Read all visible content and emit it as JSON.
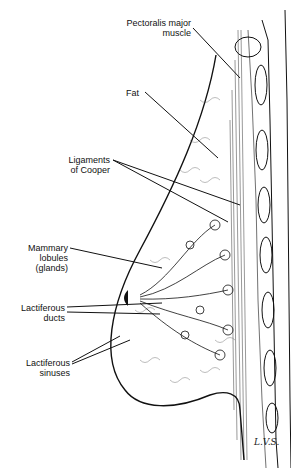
{
  "figure": {
    "type": "anatomical illustration",
    "background": "#ffffff",
    "ink": "#111111"
  },
  "labels": [
    {
      "id": "pectoralis",
      "line1": "Pectoralis major",
      "line2": "muscle"
    },
    {
      "id": "fat",
      "line1": "Fat",
      "line2": ""
    },
    {
      "id": "cooper",
      "line1": "Ligaments",
      "line2": "of Cooper"
    },
    {
      "id": "lobules",
      "line1": "Mammary",
      "line2": "lobules",
      "line3": "(glands)"
    },
    {
      "id": "ducts",
      "line1": "Lactiferous",
      "line2": "ducts"
    },
    {
      "id": "sinuses",
      "line1": "Lactiferous",
      "line2": "sinuses"
    }
  ],
  "signature": "L.V.S."
}
